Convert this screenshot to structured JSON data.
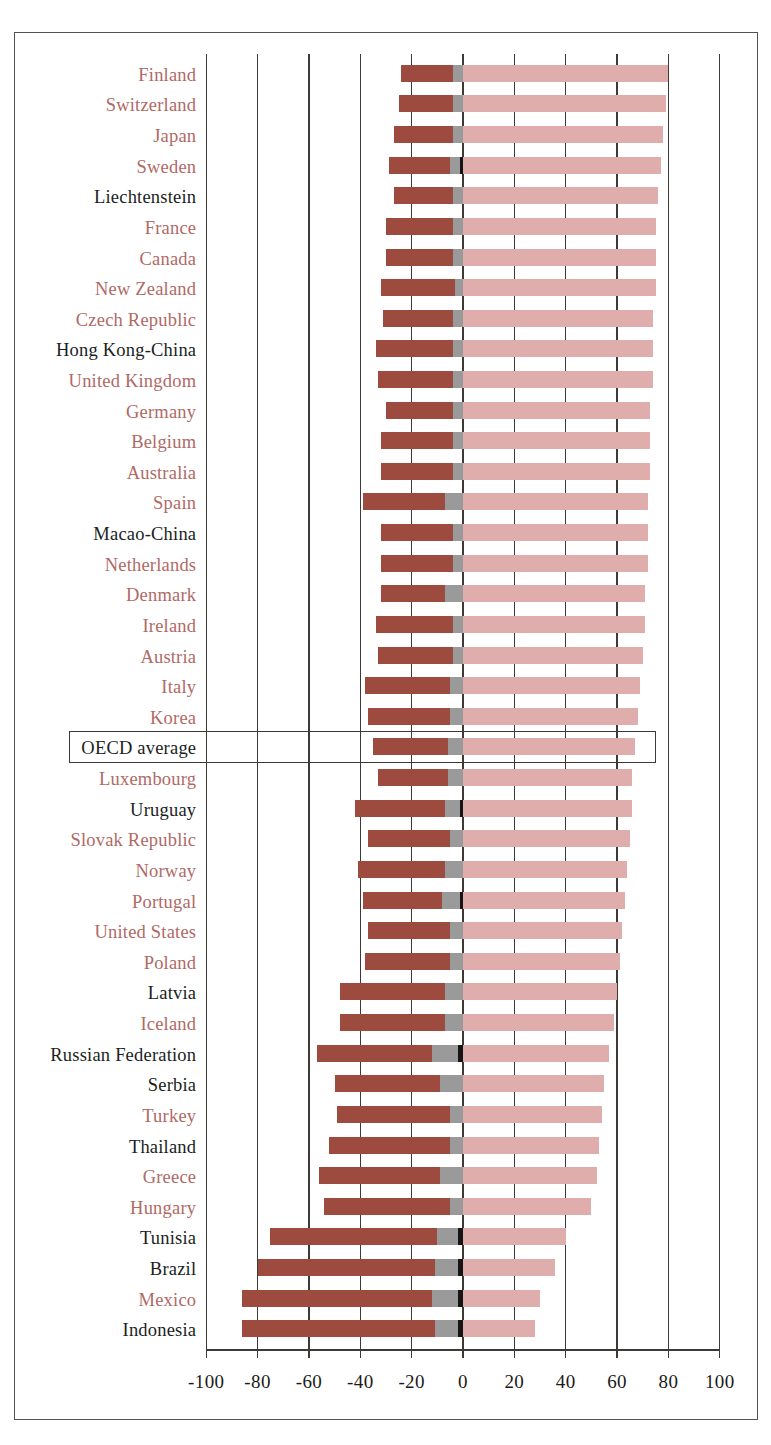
{
  "chart": {
    "type": "bar",
    "title": "",
    "xlabel": "",
    "ylabel": "",
    "orientation": "horizontal",
    "stacked": true,
    "diverging": true,
    "xlim": [
      -100,
      100
    ],
    "xticks": [
      -100,
      -80,
      -60,
      -40,
      -20,
      0,
      20,
      40,
      60,
      80,
      100
    ],
    "xtick_labels": [
      "-100",
      "-80",
      "-60",
      "-40",
      "-20",
      "0",
      "20",
      "40",
      "60",
      "80",
      "100"
    ],
    "gridlines": true,
    "legend_position": "none",
    "colors": {
      "neg_major": "#9d4b3e",
      "neg_mid": "#9a9a9a",
      "neg_small": "#151515",
      "pos": "#dfadab",
      "oecd_label": "#b06a66",
      "partner_label": "#201e1d",
      "axis": "#3d3937",
      "frame": "#55504e"
    },
    "highlight_row": "OECD average"
  },
  "chart_data": {
    "type": "bar",
    "title": "",
    "xlabel": "",
    "ylabel": "",
    "xlim": [
      -100,
      100
    ],
    "xticks": [
      -100,
      -80,
      -60,
      -40,
      -20,
      0,
      20,
      40,
      60,
      80,
      100
    ],
    "grid": true,
    "stacked": true,
    "series": [
      {
        "name": "neg_major",
        "color": "#9d4b3e"
      },
      {
        "name": "neg_mid",
        "color": "#9a9a9a"
      },
      {
        "name": "neg_small",
        "color": "#151515"
      },
      {
        "name": "pos",
        "color": "#dfadab"
      }
    ],
    "categories": [
      "Finland",
      "Switzerland",
      "Japan",
      "Sweden",
      "Liechtenstein",
      "France",
      "Canada",
      "New Zealand",
      "Czech Republic",
      "Hong Kong-China",
      "United Kingdom",
      "Germany",
      "Belgium",
      "Australia",
      "Spain",
      "Macao-China",
      "Netherlands",
      "Denmark",
      "Ireland",
      "Austria",
      "Italy",
      "Korea",
      "OECD average",
      "Luxembourg",
      "Uruguay",
      "Slovak Republic",
      "Norway",
      "Portugal",
      "United States",
      "Poland",
      "Latvia",
      "Iceland",
      "Russian Federation",
      "Serbia",
      "Turkey",
      "Thailand",
      "Greece",
      "Hungary",
      "Tunisia",
      "Brazil",
      "Mexico",
      "Indonesia"
    ],
    "rows": [
      {
        "label": "Finland",
        "oecd": true,
        "neg_major": -20,
        "neg_mid": -4,
        "neg_small": 0,
        "pos": 80
      },
      {
        "label": "Switzerland",
        "oecd": true,
        "neg_major": -21,
        "neg_mid": -4,
        "neg_small": 0,
        "pos": 79
      },
      {
        "label": "Japan",
        "oecd": true,
        "neg_major": -23,
        "neg_mid": -4,
        "neg_small": 0,
        "pos": 78
      },
      {
        "label": "Sweden",
        "oecd": true,
        "neg_major": -24,
        "neg_mid": -4,
        "neg_small": -1,
        "pos": 77
      },
      {
        "label": "Liechtenstein",
        "oecd": false,
        "neg_major": -23,
        "neg_mid": -4,
        "neg_small": 0,
        "pos": 76
      },
      {
        "label": "France",
        "oecd": true,
        "neg_major": -26,
        "neg_mid": -4,
        "neg_small": 0,
        "pos": 75
      },
      {
        "label": "Canada",
        "oecd": true,
        "neg_major": -26,
        "neg_mid": -4,
        "neg_small": 0,
        "pos": 75
      },
      {
        "label": "New Zealand",
        "oecd": true,
        "neg_major": -29,
        "neg_mid": -3,
        "neg_small": 0,
        "pos": 75
      },
      {
        "label": "Czech Republic",
        "oecd": true,
        "neg_major": -27,
        "neg_mid": -4,
        "neg_small": 0,
        "pos": 74
      },
      {
        "label": "Hong Kong-China",
        "oecd": false,
        "neg_major": -30,
        "neg_mid": -4,
        "neg_small": 0,
        "pos": 74
      },
      {
        "label": "United Kingdom",
        "oecd": true,
        "neg_major": -29,
        "neg_mid": -4,
        "neg_small": 0,
        "pos": 74
      },
      {
        "label": "Germany",
        "oecd": true,
        "neg_major": -26,
        "neg_mid": -4,
        "neg_small": 0,
        "pos": 73
      },
      {
        "label": "Belgium",
        "oecd": true,
        "neg_major": -28,
        "neg_mid": -4,
        "neg_small": 0,
        "pos": 73
      },
      {
        "label": "Australia",
        "oecd": true,
        "neg_major": -28,
        "neg_mid": -4,
        "neg_small": 0,
        "pos": 73
      },
      {
        "label": "Spain",
        "oecd": true,
        "neg_major": -32,
        "neg_mid": -7,
        "neg_small": 0,
        "pos": 72
      },
      {
        "label": "Macao-China",
        "oecd": false,
        "neg_major": -28,
        "neg_mid": -4,
        "neg_small": 0,
        "pos": 72
      },
      {
        "label": "Netherlands",
        "oecd": true,
        "neg_major": -28,
        "neg_mid": -4,
        "neg_small": 0,
        "pos": 72
      },
      {
        "label": "Denmark",
        "oecd": true,
        "neg_major": -25,
        "neg_mid": -7,
        "neg_small": 0,
        "pos": 71
      },
      {
        "label": "Ireland",
        "oecd": true,
        "neg_major": -30,
        "neg_mid": -4,
        "neg_small": 0,
        "pos": 71
      },
      {
        "label": "Austria",
        "oecd": true,
        "neg_major": -29,
        "neg_mid": -4,
        "neg_small": 0,
        "pos": 70
      },
      {
        "label": "Italy",
        "oecd": true,
        "neg_major": -33,
        "neg_mid": -5,
        "neg_small": 0,
        "pos": 69
      },
      {
        "label": "Korea",
        "oecd": true,
        "neg_major": -32,
        "neg_mid": -5,
        "neg_small": 0,
        "pos": 68
      },
      {
        "label": "OECD average",
        "oecd": false,
        "neg_major": -29,
        "neg_mid": -6,
        "neg_small": 0,
        "pos": 67
      },
      {
        "label": "Luxembourg",
        "oecd": true,
        "neg_major": -27,
        "neg_mid": -6,
        "neg_small": 0,
        "pos": 66
      },
      {
        "label": "Uruguay",
        "oecd": false,
        "neg_major": -35,
        "neg_mid": -6,
        "neg_small": -1,
        "pos": 66
      },
      {
        "label": "Slovak Republic",
        "oecd": true,
        "neg_major": -32,
        "neg_mid": -5,
        "neg_small": 0,
        "pos": 65
      },
      {
        "label": "Norway",
        "oecd": true,
        "neg_major": -34,
        "neg_mid": -7,
        "neg_small": 0,
        "pos": 64
      },
      {
        "label": "Portugal",
        "oecd": true,
        "neg_major": -31,
        "neg_mid": -7,
        "neg_small": -1,
        "pos": 63
      },
      {
        "label": "United States",
        "oecd": true,
        "neg_major": -32,
        "neg_mid": -5,
        "neg_small": 0,
        "pos": 62
      },
      {
        "label": "Poland",
        "oecd": true,
        "neg_major": -33,
        "neg_mid": -5,
        "neg_small": 0,
        "pos": 61
      },
      {
        "label": "Latvia",
        "oecd": false,
        "neg_major": -41,
        "neg_mid": -7,
        "neg_small": 0,
        "pos": 60
      },
      {
        "label": "Iceland",
        "oecd": true,
        "neg_major": -41,
        "neg_mid": -7,
        "neg_small": 0,
        "pos": 59
      },
      {
        "label": "Russian Federation",
        "oecd": false,
        "neg_major": -45,
        "neg_mid": -10,
        "neg_small": -2,
        "pos": 57
      },
      {
        "label": "Serbia",
        "oecd": false,
        "neg_major": -41,
        "neg_mid": -9,
        "neg_small": 0,
        "pos": 55
      },
      {
        "label": "Turkey",
        "oecd": true,
        "neg_major": -44,
        "neg_mid": -5,
        "neg_small": 0,
        "pos": 54
      },
      {
        "label": "Thailand",
        "oecd": false,
        "neg_major": -47,
        "neg_mid": -5,
        "neg_small": 0,
        "pos": 53
      },
      {
        "label": "Greece",
        "oecd": true,
        "neg_major": -47,
        "neg_mid": -9,
        "neg_small": 0,
        "pos": 52
      },
      {
        "label": "Hungary",
        "oecd": true,
        "neg_major": -49,
        "neg_mid": -5,
        "neg_small": 0,
        "pos": 50
      },
      {
        "label": "Tunisia",
        "oecd": false,
        "neg_major": -65,
        "neg_mid": -8,
        "neg_small": -2,
        "pos": 40
      },
      {
        "label": "Brazil",
        "oecd": false,
        "neg_major": -69,
        "neg_mid": -9,
        "neg_small": -2,
        "pos": 36
      },
      {
        "label": "Mexico",
        "oecd": true,
        "neg_major": -74,
        "neg_mid": -10,
        "neg_small": -2,
        "pos": 30
      },
      {
        "label": "Indonesia",
        "oecd": false,
        "neg_major": -75,
        "neg_mid": -9,
        "neg_small": -2,
        "pos": 28
      }
    ]
  }
}
